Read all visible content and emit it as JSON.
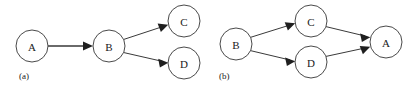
{
  "figure": {
    "background_color": "#ffffff",
    "stroke_color": "#3a3a3a",
    "node_fill_color": "#ffffff",
    "node_stroke_color": "#4a4a4a",
    "text_color": "#1a1a1a",
    "arrow_color": "#1f1f1f"
  },
  "diagrams": [
    {
      "id": "diagram-a",
      "caption": "(a)",
      "nodes": [
        {
          "id": "a-node-a",
          "label": "A",
          "cx": 32,
          "cy": 46,
          "r": 16
        },
        {
          "id": "a-node-b",
          "label": "B",
          "cx": 109,
          "cy": 46,
          "r": 16
        },
        {
          "id": "a-node-c",
          "label": "C",
          "cx": 184,
          "cy": 21,
          "r": 16
        },
        {
          "id": "a-node-d",
          "label": "D",
          "cx": 184,
          "cy": 63,
          "r": 16
        }
      ],
      "edges": [
        {
          "id": "a-edge-ab",
          "from": "A",
          "to": "B",
          "style": "thick"
        },
        {
          "id": "a-edge-bc",
          "from": "B",
          "to": "C",
          "style": "thin"
        },
        {
          "id": "a-edge-bd",
          "from": "B",
          "to": "D",
          "style": "thin"
        }
      ]
    },
    {
      "id": "diagram-b",
      "caption": "(b)",
      "nodes": [
        {
          "id": "b-node-b",
          "label": "B",
          "cx": 236,
          "cy": 44,
          "r": 16
        },
        {
          "id": "b-node-c",
          "label": "C",
          "cx": 311,
          "cy": 21,
          "r": 16
        },
        {
          "id": "b-node-d",
          "label": "D",
          "cx": 311,
          "cy": 62,
          "r": 16
        },
        {
          "id": "b-node-a",
          "label": "A",
          "cx": 386,
          "cy": 42,
          "r": 16
        }
      ],
      "edges": [
        {
          "id": "b-edge-bc",
          "from": "B",
          "to": "C",
          "style": "thin"
        },
        {
          "id": "b-edge-bd",
          "from": "B",
          "to": "D",
          "style": "thin"
        },
        {
          "id": "b-edge-ca",
          "from": "C",
          "to": "A",
          "style": "thin"
        },
        {
          "id": "b-edge-da",
          "from": "D",
          "to": "A",
          "style": "thin"
        }
      ]
    }
  ],
  "captions": {
    "a": "(a)",
    "b": "(b)"
  },
  "labels": {
    "a_node_a": "A",
    "a_node_b": "B",
    "a_node_c": "C",
    "a_node_d": "D",
    "b_node_b": "B",
    "b_node_c": "C",
    "b_node_d": "D",
    "b_node_a": "A"
  }
}
